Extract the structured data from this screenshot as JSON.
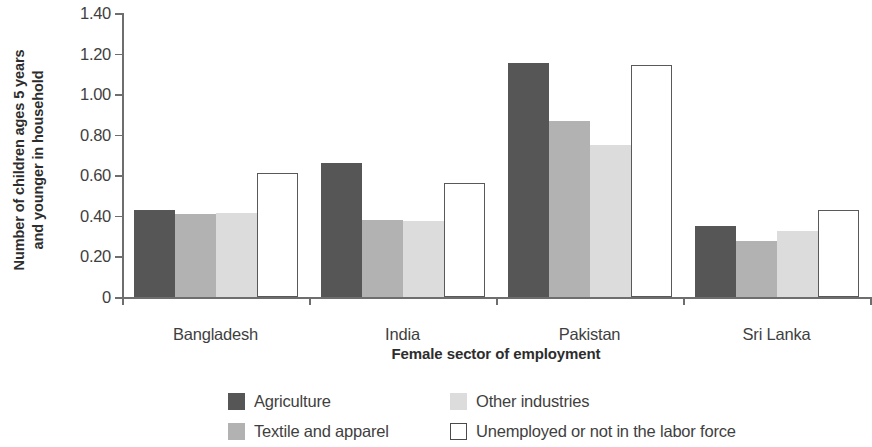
{
  "chart_data": {
    "type": "bar",
    "title": "",
    "xlabel": "Female sector of employment",
    "ylabel": "Number of children ages 5 years and younger in household",
    "ylabel_line1": "Number of children ages 5 years",
    "ylabel_line2": "and younger in household",
    "categories": [
      "Bangladesh",
      "India",
      "Pakistan",
      "Sri Lanka"
    ],
    "series": [
      {
        "name": "Agriculture",
        "color": "#565656",
        "style": "filled",
        "values": [
          0.43,
          0.66,
          1.155,
          0.35
        ]
      },
      {
        "name": "Textile and apparel",
        "color": "#b2b2b2",
        "style": "filled",
        "values": [
          0.41,
          0.38,
          0.87,
          0.275
        ]
      },
      {
        "name": "Other industries",
        "color": "#dcdcdc",
        "style": "filled",
        "values": [
          0.415,
          0.375,
          0.75,
          0.325
        ]
      },
      {
        "name": "Unemployed or not in the labor force",
        "color": "#ffffff",
        "style": "outline",
        "values": [
          0.61,
          0.56,
          1.145,
          0.43
        ]
      }
    ],
    "ylim": [
      0,
      1.4
    ],
    "yticks": [
      0,
      0.2,
      0.4,
      0.6,
      0.8,
      1.0,
      1.2,
      1.4
    ],
    "ytick_labels": [
      "0",
      "0.20",
      "0.40",
      "0.60",
      "0.80",
      "1.00",
      "1.20",
      "1.40"
    ],
    "grid": false,
    "legend_position": "bottom",
    "legend_order": [
      "Agriculture",
      "Other industries",
      "Textile and apparel",
      "Unemployed or not in the labor force"
    ],
    "axis_color": "#6e6e6e",
    "outline_color": "#595959"
  }
}
